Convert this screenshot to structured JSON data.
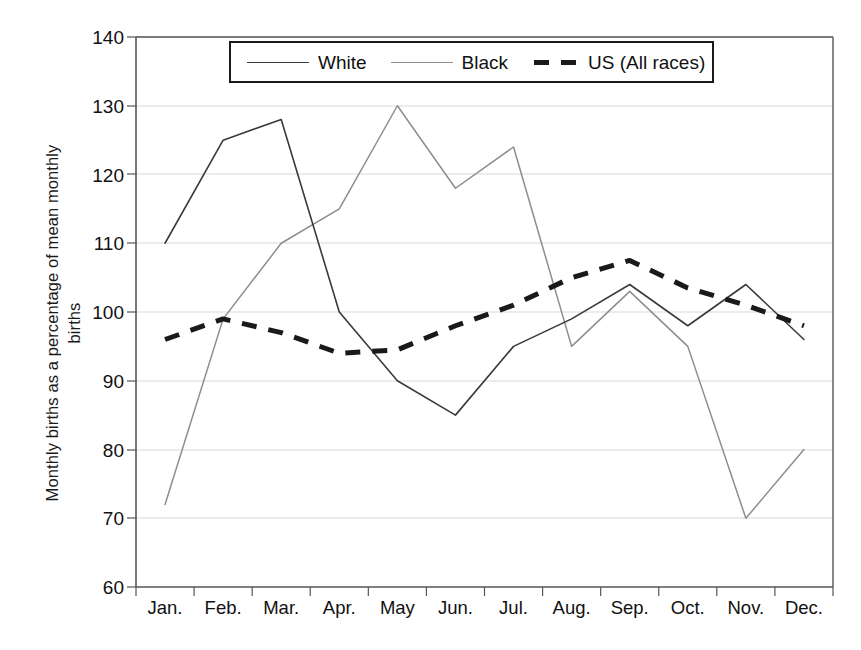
{
  "chart_data": {
    "type": "line",
    "title": "",
    "xlabel": "",
    "ylabel": "Monthly births as a percentage of mean monthly births",
    "ylabel_line1": "Monthly births as a percentage of mean monthly",
    "ylabel_line2": "births",
    "categories": [
      "Jan.",
      "Feb.",
      "Mar.",
      "Apr.",
      "May",
      "Jun.",
      "Jul.",
      "Aug.",
      "Sep.",
      "Oct.",
      "Nov.",
      "Dec."
    ],
    "ylim": [
      60,
      140
    ],
    "yticks": [
      140,
      130,
      120,
      110,
      100,
      90,
      80,
      70,
      60
    ],
    "ytick_labels": [
      "140",
      "130",
      "120",
      "110",
      "100",
      "90",
      "80",
      "70",
      "60"
    ],
    "grid": true,
    "grid_axis": "y",
    "legend_position": "top-center",
    "series": [
      {
        "name": "White",
        "style": "solid",
        "color": "#3a3a3a",
        "width": 1.6,
        "values": [
          110,
          125,
          128,
          100,
          90,
          85,
          95,
          99,
          104,
          98,
          104,
          96
        ]
      },
      {
        "name": "Black",
        "style": "solid",
        "color": "#8d8d8d",
        "width": 1.5,
        "values": [
          72,
          99,
          110,
          115,
          130,
          118,
          124,
          95,
          103,
          95,
          70,
          80
        ]
      },
      {
        "name": "US (All races)",
        "style": "dashed",
        "color": "#1a1a1a",
        "width": 5,
        "values": [
          96,
          99,
          97,
          94,
          94.5,
          98,
          101,
          105,
          107.5,
          103.5,
          101,
          98
        ]
      }
    ]
  },
  "legend": {
    "entries": [
      {
        "label": "White"
      },
      {
        "label": "Black"
      },
      {
        "label": "US (All races)"
      }
    ]
  },
  "axes": {
    "y_title_line1": "Monthly births as a percentage of mean monthly",
    "y_title_line2": "births",
    "y_tick_labels": [
      "140",
      "130",
      "120",
      "110",
      "100",
      "90",
      "80",
      "70",
      "60"
    ],
    "x_tick_labels": [
      "Jan.",
      "Feb.",
      "Mar.",
      "Apr.",
      "May",
      "Jun.",
      "Jul.",
      "Aug.",
      "Sep.",
      "Oct.",
      "Nov.",
      "Dec."
    ]
  },
  "colors": {
    "white_series": "#3a3a3a",
    "black_series": "#8d8d8d",
    "us_series": "#1a1a1a",
    "grid": "#d9d9d9",
    "axis": "#555555",
    "background": "#ffffff"
  }
}
